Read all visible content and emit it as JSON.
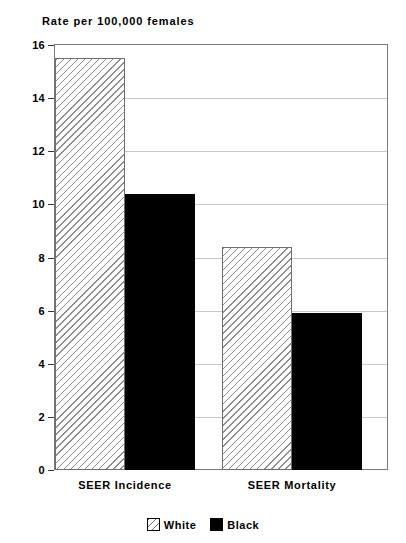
{
  "clipped_header_text": "------ -- -----",
  "chart_data": {
    "type": "bar",
    "title": "",
    "ylabel": "Rate per 100,000 females",
    "xlabel": "",
    "categories": [
      "SEER Incidence",
      "SEER Mortality"
    ],
    "series": [
      {
        "name": "White",
        "values": [
          15.5,
          8.4
        ],
        "fill": "diagonal-hatch"
      },
      {
        "name": "Black",
        "values": [
          10.4,
          5.9
        ],
        "fill": "solid-black"
      }
    ],
    "ylim": [
      0,
      16
    ],
    "y_ticks": [
      0,
      2,
      4,
      6,
      8,
      10,
      12,
      14,
      16
    ],
    "y_tick_labels": [
      "0",
      "2",
      "4",
      "6",
      "8",
      "10",
      "12",
      "14",
      "16"
    ],
    "grid": true,
    "legend_position": "bottom-center",
    "colors": {
      "black_series": "#000000",
      "hatch_line": "#8c8c8c",
      "hatch_background": "#ffffff",
      "frame": "#7a7a7a",
      "gridline": "#c9c9c9"
    }
  },
  "legend": {
    "entries": [
      {
        "label": "White",
        "swatch": "hatch-swatch-icon"
      },
      {
        "label": "Black",
        "swatch": "black-swatch-icon"
      }
    ]
  }
}
